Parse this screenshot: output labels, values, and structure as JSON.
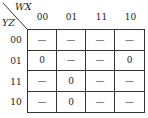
{
  "kmap": {
    "col_var": "WX",
    "row_var": "YZ",
    "col_headers": [
      "00",
      "01",
      "11",
      "10"
    ],
    "row_headers": [
      "00",
      "01",
      "11",
      "10"
    ],
    "cells": [
      [
        "—",
        "—",
        "—",
        "—"
      ],
      [
        "0",
        "—",
        "—",
        "0"
      ],
      [
        "—",
        "0",
        "—",
        "—"
      ],
      [
        "—",
        "0",
        "—",
        "—"
      ]
    ]
  }
}
